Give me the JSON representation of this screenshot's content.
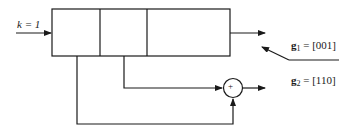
{
  "diagram": {
    "type": "convolutional-encoder",
    "input_label": "k = 1",
    "register": {
      "cells": 3
    },
    "adder_symbol": "+",
    "generators": [
      {
        "name": "g",
        "sub": "1",
        "value": "= [001]"
      },
      {
        "name": "g",
        "sub": "2",
        "value": "= [110]"
      }
    ],
    "colors": {
      "stroke": "#1a1a1a",
      "background": "#ffffff"
    }
  }
}
